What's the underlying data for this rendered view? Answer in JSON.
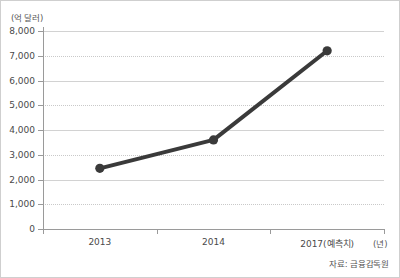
{
  "chart_data": {
    "type": "line",
    "title": "",
    "subtitle": "",
    "unit_label": "(억 달러)",
    "xlabel": "(년)",
    "ylabel": "",
    "categories": [
      "2013",
      "2014",
      "2017(예측치)"
    ],
    "x_tick_labels": [
      "2013",
      "2014",
      "2017(예측치)"
    ],
    "y_tick_labels": [
      "0",
      "1,000",
      "2,000",
      "3,000",
      "4,000",
      "5,000",
      "6,000",
      "7,000",
      "8,000"
    ],
    "y_tick_values": [
      0,
      1000,
      2000,
      3000,
      4000,
      5000,
      6000,
      7000,
      8000
    ],
    "ylim": [
      0,
      8000
    ],
    "grid": true,
    "legend": "none",
    "series": [
      {
        "name": "수출액",
        "values": [
          2450,
          3600,
          7200
        ],
        "color": "#3a3a3a",
        "marker": "circle",
        "line_width": 4
      }
    ],
    "annotations": [],
    "source": "자료: 금융감독원"
  },
  "figure": {
    "unit_label": "(억 달러)",
    "x_unit": "(년)",
    "source": "자료: 금융감독원"
  }
}
